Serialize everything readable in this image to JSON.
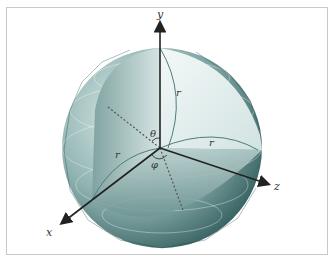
{
  "figure": {
    "axes": {
      "y_label": "y",
      "z_label": "z",
      "x_label": "x"
    },
    "annotations": {
      "r_top": "r",
      "r_right": "r",
      "r_left": "r",
      "theta": "θ",
      "phi": "φ"
    },
    "colors": {
      "sphere_dark": "#2f5a5a",
      "sphere_mid": "#8fb3b1",
      "sphere_light": "#e6f0ef",
      "axis": "#222222",
      "arc": "#4f7d7a",
      "frame": "#c9c9c9"
    }
  }
}
